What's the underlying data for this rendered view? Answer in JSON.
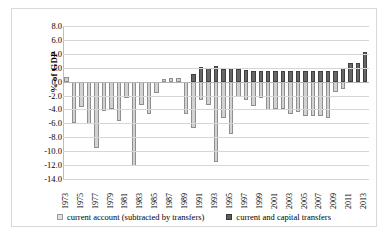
{
  "chart_data": {
    "type": "bar",
    "title": "",
    "subtitle": "",
    "xlabel": "",
    "ylabel": "% of GDP",
    "ylim": [
      -14.0,
      8.0
    ],
    "ytick_step": 2.0,
    "yticks": [
      "8.0",
      "6.0",
      "4.0",
      "2.0",
      "0.0",
      "-2.0",
      "-4.0",
      "-6.0",
      "-8.0",
      "-10.0",
      "-12.0",
      "-14.0"
    ],
    "grid": true,
    "stacked": true,
    "legend_position": "bottom",
    "legend": [
      "current account (subtracted by transfers)",
      "current and capital transfers"
    ],
    "colors": {
      "current_account": "#d2d2d2",
      "transfers": "#676767",
      "grid": "#d6d6d6",
      "axis": "#bdbdbd",
      "frame": "#d9d9d9",
      "text": "#000000"
    },
    "categories": [
      1973,
      1974,
      1975,
      1976,
      1977,
      1978,
      1979,
      1980,
      1981,
      1982,
      1983,
      1984,
      1985,
      1986,
      1987,
      1988,
      1989,
      1990,
      1991,
      1992,
      1993,
      1994,
      1995,
      1996,
      1997,
      1998,
      1999,
      2000,
      2001,
      2002,
      2003,
      2004,
      2005,
      2006,
      2007,
      2008,
      2009,
      2010,
      2011,
      2012,
      2013
    ],
    "tick_labels": [
      "1973",
      "1975",
      "1977",
      "1979",
      "1981",
      "1983",
      "1985",
      "1987",
      "1989",
      "1991",
      "1993",
      "1995",
      "1997",
      "1999",
      "2001",
      "2003",
      "2005",
      "2007",
      "2009",
      "2011",
      "2013"
    ],
    "series": [
      {
        "name": "current account (subtracted by transfers)",
        "values": [
          0.6,
          -5.9,
          -3.6,
          -6.1,
          -9.5,
          -4.2,
          -3.9,
          -5.7,
          -2.4,
          -12.2,
          -3.4,
          -4.7,
          -1.6,
          0.4,
          0.5,
          0.5,
          -4.7,
          -6.6,
          -2.6,
          -3.3,
          -11.5,
          -5.2,
          -7.6,
          -2.2,
          -2.7,
          -3.5,
          -2.3,
          -4.1,
          -4.0,
          -4.0,
          -4.6,
          -4.3,
          -5.0,
          -5.0,
          -5.0,
          -5.2,
          -1.5,
          -1.0,
          0.6,
          1.6,
          1.7
        ]
      },
      {
        "name": "current and capital transfers",
        "values": [
          0.0,
          0.0,
          0.0,
          0.0,
          0.0,
          0.0,
          0.0,
          0.0,
          0.0,
          0.0,
          0.0,
          0.0,
          0.0,
          0.0,
          0.0,
          0.0,
          0.0,
          1.1,
          2.1,
          2.0,
          2.2,
          1.8,
          2.0,
          1.8,
          1.7,
          1.6,
          1.6,
          1.6,
          1.5,
          1.6,
          1.5,
          1.5,
          1.6,
          1.6,
          1.5,
          1.5,
          1.6,
          2.0,
          2.7,
          2.7,
          4.2
        ]
      }
    ]
  }
}
